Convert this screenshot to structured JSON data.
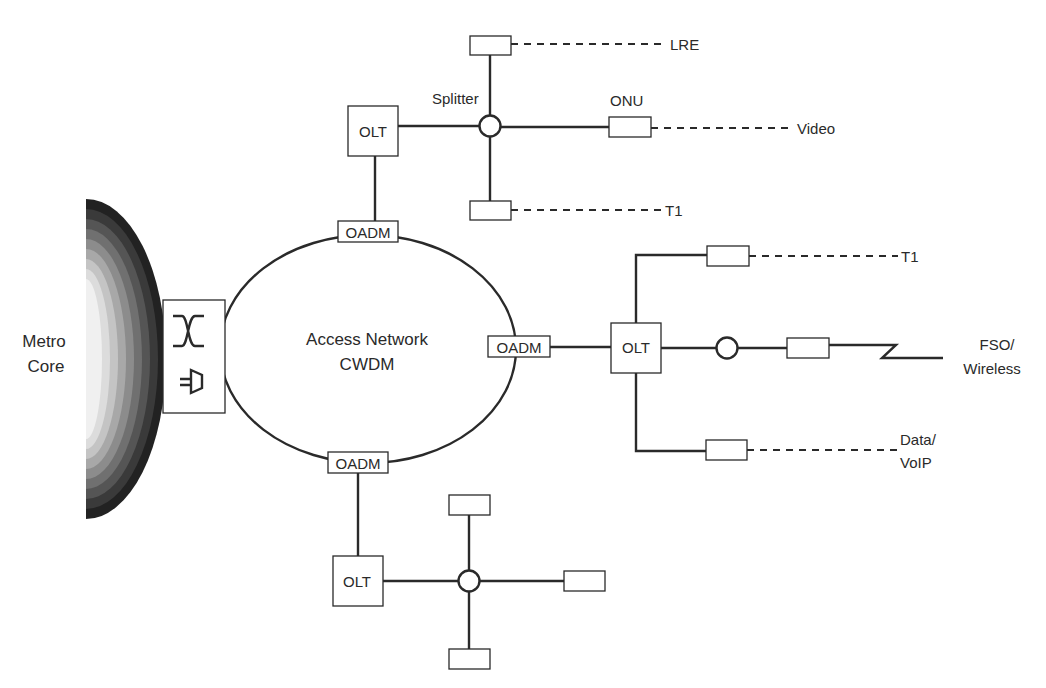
{
  "diagram": {
    "metro_core": {
      "line1": "Metro",
      "line2": "Core"
    },
    "ring": {
      "line1": "Access Network",
      "line2": "CWDM"
    },
    "oadm_label": "OADM",
    "olt_label": "OLT",
    "top_branch": {
      "splitter_label": "Splitter",
      "onu_label": "ONU",
      "services": {
        "top": "LRE",
        "right": "Video",
        "bottom": "T1"
      }
    },
    "right_branch": {
      "services": {
        "top": "T1",
        "middle_line1": "FSO/",
        "middle_line2": "Wireless",
        "bottom_line1": "Data/",
        "bottom_line2": "VoIP"
      }
    },
    "bottom_branch": {}
  }
}
